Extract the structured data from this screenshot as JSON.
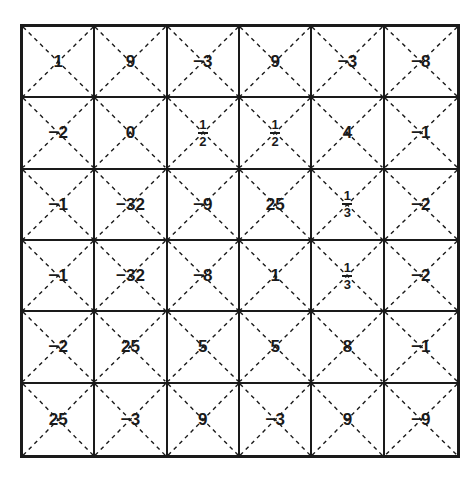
{
  "grid": {
    "rows": 6,
    "cols": 6,
    "cells": [
      [
        {
          "text": "1"
        },
        {
          "text": "9"
        },
        {
          "text": "−3"
        },
        {
          "text": "9"
        },
        {
          "text": "−3"
        },
        {
          "text": "−8"
        }
      ],
      [
        {
          "text": "−2"
        },
        {
          "text": "0"
        },
        {
          "num": "1",
          "den": "2"
        },
        {
          "num": "1",
          "den": "2"
        },
        {
          "text": "4"
        },
        {
          "text": "−1"
        }
      ],
      [
        {
          "text": "−1"
        },
        {
          "text": "−32"
        },
        {
          "text": "−9"
        },
        {
          "text": "25"
        },
        {
          "num": "1",
          "den": "3"
        },
        {
          "text": "−2"
        }
      ],
      [
        {
          "text": "−1"
        },
        {
          "text": "−32"
        },
        {
          "text": "−8"
        },
        {
          "text": "1"
        },
        {
          "num": "1",
          "den": "3"
        },
        {
          "text": "−2"
        }
      ],
      [
        {
          "text": "−2"
        },
        {
          "text": "25"
        },
        {
          "text": "5"
        },
        {
          "text": "5"
        },
        {
          "text": "8"
        },
        {
          "text": "−1"
        }
      ],
      [
        {
          "text": "25"
        },
        {
          "text": "−3"
        },
        {
          "text": "9"
        },
        {
          "text": "−3"
        },
        {
          "text": "9"
        },
        {
          "text": "−9"
        }
      ]
    ]
  },
  "colors": {
    "line": "#1a1a1a",
    "background": "#ffffff"
  }
}
